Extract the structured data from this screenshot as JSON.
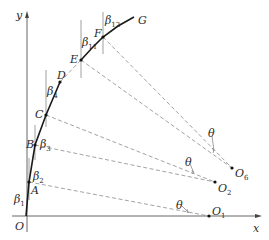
{
  "diagram": {
    "axes": {
      "x_label": "x",
      "y_label": "y",
      "origin_label": "O"
    },
    "curve_points": [
      {
        "label": "A"
      },
      {
        "label": "B"
      },
      {
        "label": "C"
      },
      {
        "label": "D"
      },
      {
        "label": "E"
      },
      {
        "label": "F"
      },
      {
        "label": "G"
      }
    ],
    "centers": [
      {
        "label": "O",
        "sub": "1"
      },
      {
        "label": "O",
        "sub": "2"
      },
      {
        "label": "O",
        "sub": "6"
      }
    ],
    "angles": [
      {
        "label": "β",
        "sub": "1"
      },
      {
        "label": "β",
        "sub": "2"
      },
      {
        "label": "β",
        "sub": "3"
      },
      {
        "label": "β",
        "sub": "4"
      },
      {
        "label": "β",
        "sub": "11"
      },
      {
        "label": "β",
        "sub": "12"
      }
    ],
    "theta_label": "θ"
  }
}
